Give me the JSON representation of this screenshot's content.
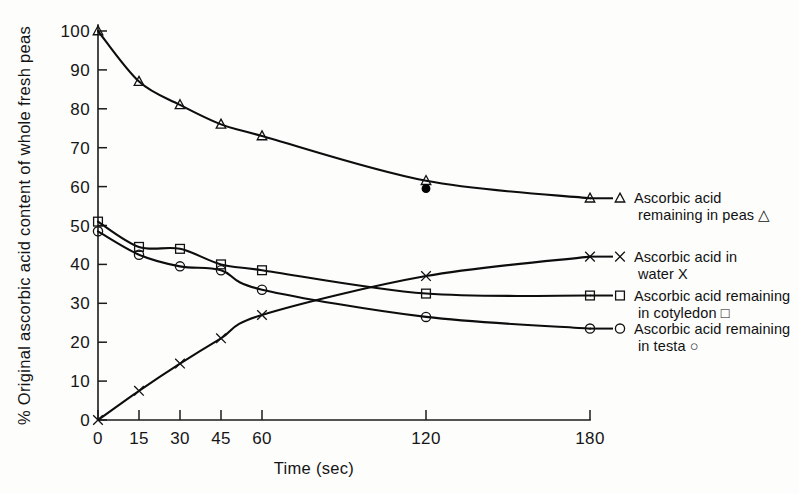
{
  "chart_data": {
    "type": "line",
    "title": "",
    "xlabel": "Time (sec)",
    "ylabel": "% Original ascorbic acid content of whole fresh peas",
    "xlim": [
      0,
      180
    ],
    "ylim": [
      0,
      100
    ],
    "xticks": [
      0,
      15,
      30,
      45,
      60,
      120,
      180
    ],
    "xtick_labels": [
      "0",
      "15",
      "30",
      "45",
      "60",
      "120",
      "180"
    ],
    "yticks": [
      0,
      10,
      20,
      30,
      40,
      50,
      60,
      70,
      80,
      90,
      100
    ],
    "ytick_labels": [
      "0",
      "10",
      "20",
      "30",
      "40",
      "50",
      "60",
      "70",
      "80",
      "90",
      "100"
    ],
    "grid": false,
    "legend_position": "right",
    "x": [
      0,
      15,
      30,
      45,
      60,
      120,
      180
    ],
    "series": [
      {
        "name": "Ascorbic acid remaining in peas",
        "marker": "triangle",
        "legend_line1": "Ascorbic acid",
        "legend_line2": "remaining in peas △",
        "values": [
          100,
          87,
          81,
          76,
          73,
          61.5,
          57
        ]
      },
      {
        "name": "Ascorbic acid in water",
        "marker": "x",
        "legend_line1": "Ascorbic acid in",
        "legend_line2": "water  X",
        "values": [
          0,
          7.5,
          14.5,
          21,
          27,
          37,
          42
        ]
      },
      {
        "name": "Ascorbic acid remaining in cotyledon",
        "marker": "square",
        "legend_line1": "Ascorbic acid remaining",
        "legend_line2": "in cotyledon □",
        "values": [
          51,
          44.5,
          44,
          40,
          38.5,
          32.5,
          32
        ]
      },
      {
        "name": "Ascorbic acid remaining in testa",
        "marker": "circle",
        "legend_line1": "Ascorbic acid remaining",
        "legend_line2": "in testa ○",
        "values": [
          48.5,
          42.5,
          39.5,
          38.5,
          33.5,
          26.5,
          23.5
        ]
      }
    ],
    "extra_points": [
      {
        "name": "filled-marker-peas-120s",
        "marker": "filled-circle",
        "x": 120,
        "y": 59.5
      }
    ]
  },
  "figure": {
    "background": "#fdfdfc",
    "ink_color": "#111111"
  }
}
